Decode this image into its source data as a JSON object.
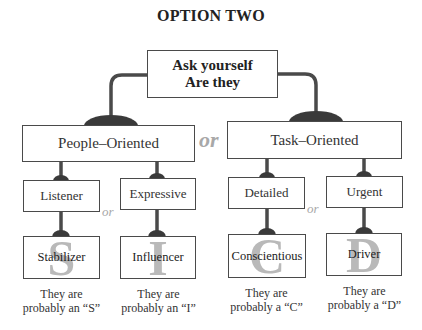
{
  "title": "OPTION TWO",
  "root": {
    "line1": "Ask yourself",
    "line2": "Are they"
  },
  "or_label": "or",
  "branches": [
    {
      "label": "People–Oriented",
      "traits": [
        {
          "label": "Listener",
          "result": "Stabilizer",
          "letter": "S",
          "caption_line1": "They are",
          "caption_line2": "probably an “S”"
        },
        {
          "label": "Expressive",
          "result": "Influencer",
          "letter": "I",
          "caption_line1": "They are",
          "caption_line2": "probably an “I”"
        }
      ]
    },
    {
      "label": "Task–Oriented",
      "traits": [
        {
          "label": "Detailed",
          "result": "Conscientious",
          "letter": "C",
          "caption_line1": "They are",
          "caption_line2": "probably a “C”"
        },
        {
          "label": "Urgent",
          "result": "Driver",
          "letter": "D",
          "caption_line1": "They are",
          "caption_line2": "probably a “D”"
        }
      ]
    }
  ],
  "colors": {
    "line": "#4a4a4a",
    "letter": "#b9b9b9",
    "or": "#a8a8a8"
  }
}
